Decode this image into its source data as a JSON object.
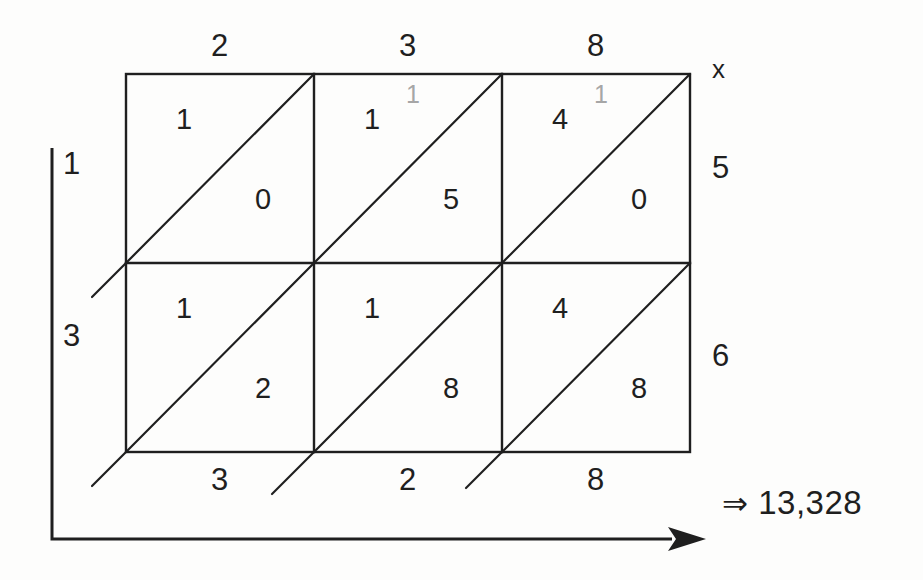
{
  "colors": {
    "ink": "#1f1f1f",
    "carry_gray": "#a6a6a6",
    "background": "#fdfdfc"
  },
  "grid": {
    "rows": 2,
    "cols": 3,
    "top_labels": [
      "2",
      "3",
      "8"
    ],
    "right_labels": [
      "5",
      "6"
    ],
    "left_labels": [
      "1",
      "3"
    ],
    "bottom_labels": [
      "3",
      "2",
      "8"
    ],
    "multiplicand": "238",
    "multiplier": "56"
  },
  "cells": [
    {
      "row": 0,
      "col": 0,
      "upper": "1",
      "lower": "0",
      "carry": ""
    },
    {
      "row": 0,
      "col": 1,
      "upper": "1",
      "lower": "5",
      "carry": "1"
    },
    {
      "row": 0,
      "col": 2,
      "upper": "4",
      "lower": "0",
      "carry": "1"
    },
    {
      "row": 1,
      "col": 0,
      "upper": "1",
      "lower": "2",
      "carry": ""
    },
    {
      "row": 1,
      "col": 1,
      "upper": "1",
      "lower": "8",
      "carry": ""
    },
    {
      "row": 1,
      "col": 2,
      "upper": "4",
      "lower": "8",
      "carry": ""
    }
  ],
  "axis": {
    "x_marker": "x"
  },
  "result": {
    "arrow": "⇒",
    "value": "13,328"
  }
}
